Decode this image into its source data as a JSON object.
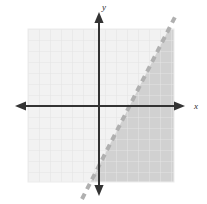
{
  "figure": {
    "name": "linear-inequality-graph",
    "width": 207,
    "height": 204,
    "background_color": "#ffffff"
  },
  "axes": {
    "x_label": "x",
    "y_label": "y",
    "axis_color": "#333333",
    "origin": {
      "x": 99,
      "y": 106
    },
    "x_axis": {
      "x_start": 15,
      "x_end": 185,
      "y": 106
    },
    "y_axis": {
      "y_start": 12,
      "y_end": 196,
      "x": 99
    }
  },
  "grid": {
    "color": "#e4e4e4",
    "cell_size": 11,
    "left": 28,
    "top": 29,
    "right": 174,
    "bottom": 182,
    "fill_color": "#f2f2f2"
  },
  "boundary_line": {
    "style": "dashed",
    "color": "#b0b0b0",
    "x1": 82,
    "y1": 199,
    "x2": 175,
    "y2": 17,
    "dash_pattern": "6 5",
    "width": 4
  },
  "shaded_region": {
    "side": "right-of-line",
    "color": "#cfcfcf",
    "description": "Region to the right of and below the dashed boundary line"
  },
  "chart_data": {
    "type": "line",
    "title": "",
    "xlabel": "x",
    "ylabel": "y",
    "grid": true,
    "legend": null,
    "xlim": [
      -6.5,
      6.8
    ],
    "ylim": [
      -7,
      7
    ],
    "series": [
      {
        "name": "boundary-line",
        "linestyle": "dashed",
        "slope": 2,
        "intercept": -5,
        "x": [
          -1.55,
          6.9
        ],
        "y": [
          -8.45,
          8.45
        ],
        "x_intercept": 2.5,
        "color": "#b0b0b0"
      }
    ],
    "shading": {
      "region": "y < 2x - 5",
      "inclusive": false,
      "color": "#cfcfcf"
    },
    "annotations": []
  }
}
